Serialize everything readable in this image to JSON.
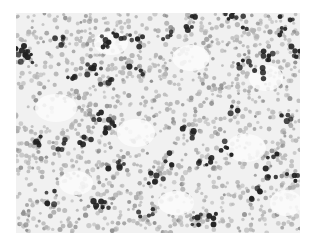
{
  "image": {
    "subject": "grayscale microscopy cell smear",
    "frame": {
      "x": 16,
      "y": 13,
      "width": 284,
      "height": 220
    },
    "colors": {
      "background": "#f1f1f1",
      "light_cell": "#b4b4b4",
      "mid_cell": "#8c8c8c",
      "dark_cell": "#222222",
      "pale_patch": "#fbfbfb"
    },
    "pale_patches": [
      [
        40,
        95,
        30,
        18
      ],
      [
        95,
        30,
        22,
        14
      ],
      [
        175,
        45,
        25,
        16
      ],
      [
        250,
        65,
        22,
        16
      ],
      [
        120,
        120,
        26,
        18
      ],
      [
        230,
        135,
        28,
        18
      ],
      [
        60,
        170,
        22,
        14
      ],
      [
        270,
        190,
        20,
        16
      ],
      [
        160,
        190,
        24,
        14
      ]
    ],
    "dark_clusters": [
      [
        12,
        45,
        8
      ],
      [
        5,
        35,
        6
      ],
      [
        40,
        25,
        5
      ],
      [
        85,
        30,
        6
      ],
      [
        78,
        55,
        7
      ],
      [
        58,
        68,
        4
      ],
      [
        88,
        68,
        5
      ],
      [
        95,
        115,
        7
      ],
      [
        120,
        28,
        5
      ],
      [
        105,
        20,
        4
      ],
      [
        150,
        25,
        4
      ],
      [
        175,
        10,
        5
      ],
      [
        210,
        2,
        5
      ],
      [
        228,
        50,
        5
      ],
      [
        250,
        45,
        6
      ],
      [
        270,
        2,
        4
      ],
      [
        280,
        40,
        5
      ],
      [
        245,
        60,
        4
      ],
      [
        265,
        20,
        4
      ],
      [
        20,
        130,
        5
      ],
      [
        50,
        130,
        4
      ],
      [
        85,
        100,
        5
      ],
      [
        70,
        125,
        4
      ],
      [
        100,
        150,
        6
      ],
      [
        140,
        165,
        6
      ],
      [
        130,
        200,
        5
      ],
      [
        160,
        230,
        3
      ],
      [
        190,
        145,
        6
      ],
      [
        210,
        135,
        5
      ],
      [
        240,
        180,
        5
      ],
      [
        255,
        160,
        4
      ],
      [
        180,
        205,
        5
      ],
      [
        200,
        205,
        4
      ],
      [
        225,
        10,
        4
      ],
      [
        270,
        105,
        4
      ],
      [
        150,
        145,
        4
      ],
      [
        170,
        120,
        5
      ],
      [
        215,
        95,
        3
      ],
      [
        275,
        165,
        4
      ],
      [
        120,
        60,
        4
      ],
      [
        255,
        145,
        3
      ],
      [
        35,
        185,
        4
      ],
      [
        85,
        195,
        8
      ]
    ]
  }
}
